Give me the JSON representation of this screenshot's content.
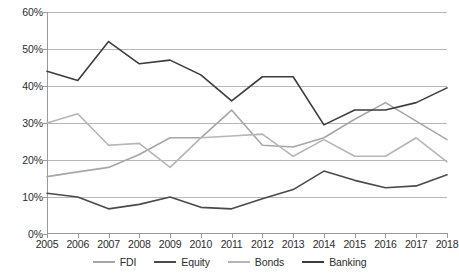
{
  "chart_data": {
    "type": "line",
    "title": "",
    "subtitle": "",
    "xlabel": "",
    "ylabel": "",
    "categories": [
      "2005",
      "2006",
      "2007",
      "2008",
      "2009",
      "2010",
      "2011",
      "2012",
      "2013",
      "2014",
      "2015",
      "2016",
      "2017",
      "2018"
    ],
    "x": [
      2005,
      2006,
      2007,
      2008,
      2009,
      2010,
      2011,
      2012,
      2013,
      2014,
      2015,
      2016,
      2017,
      2018
    ],
    "ylim": [
      0,
      60
    ],
    "ytick_labels": [
      "0%",
      "10%",
      "20%",
      "30%",
      "40%",
      "50%",
      "60%"
    ],
    "ytick_values": [
      0,
      10,
      20,
      30,
      40,
      50,
      60
    ],
    "yunit": "%",
    "grid": "horizontal",
    "legend_position": "bottom-center",
    "series": [
      {
        "name": "FDI",
        "color": "#a6a6a6",
        "values": [
          15.5,
          16.8,
          18.0,
          21.5,
          26.0,
          26.0,
          33.5,
          24.0,
          23.5,
          26.0,
          31.0,
          35.5,
          30.5,
          25.5
        ]
      },
      {
        "name": "Equity",
        "color": "#4a4a4a",
        "values": [
          11.0,
          10.0,
          6.8,
          8.0,
          10.0,
          7.2,
          6.8,
          9.5,
          12.0,
          17.0,
          14.5,
          12.5,
          13.0,
          16.0
        ]
      },
      {
        "name": "Bonds",
        "color": "#b5b5b5",
        "values": [
          30.0,
          32.5,
          24.0,
          24.5,
          18.0,
          26.0,
          26.5,
          27.0,
          21.0,
          25.5,
          21.0,
          21.0,
          26.0,
          19.5
        ]
      },
      {
        "name": "Banking",
        "color": "#3c3c3c",
        "values": [
          44.0,
          41.5,
          52.0,
          46.0,
          47.0,
          43.0,
          36.0,
          42.5,
          42.5,
          29.5,
          33.5,
          33.5,
          35.5,
          39.5
        ]
      }
    ]
  },
  "legend": {
    "items": [
      {
        "label": "FDI"
      },
      {
        "label": "Equity"
      },
      {
        "label": "Bonds"
      },
      {
        "label": "Banking"
      }
    ]
  }
}
